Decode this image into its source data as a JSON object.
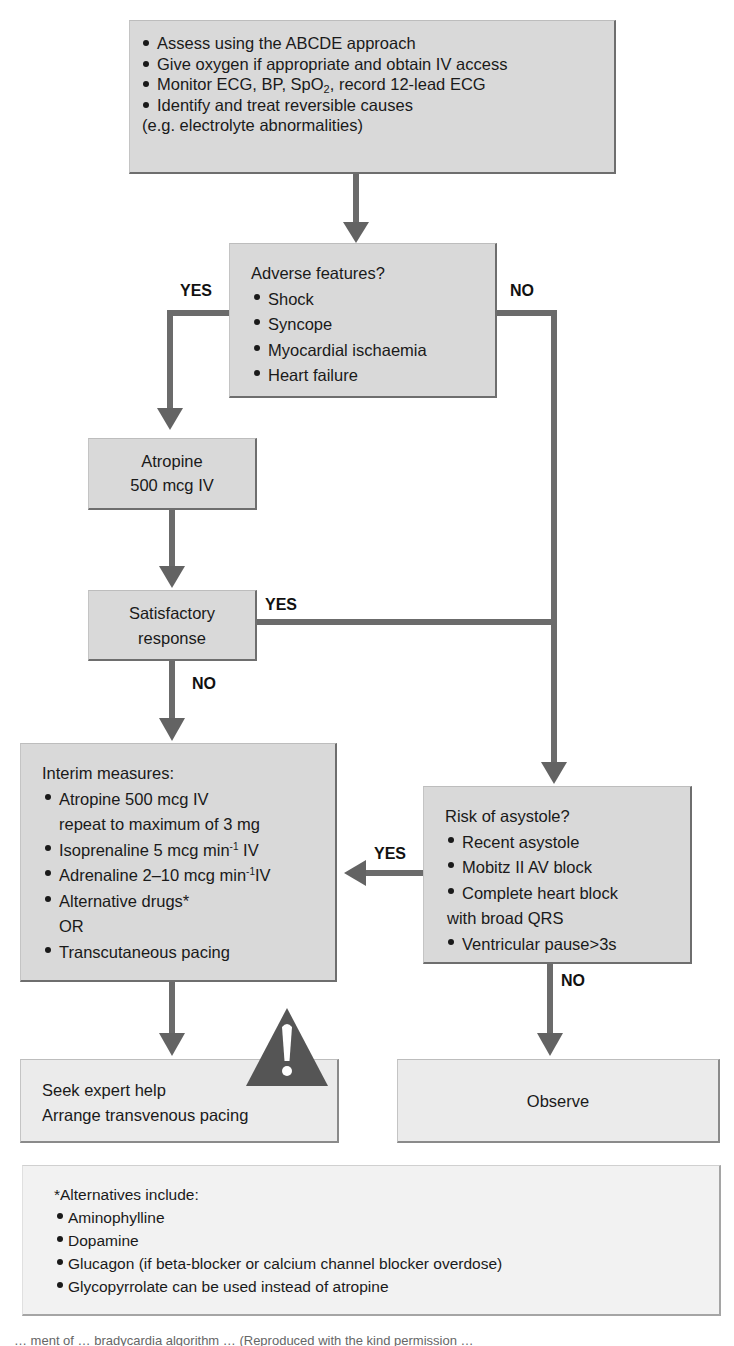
{
  "diagram": {
    "type": "flowchart",
    "title": "Bradycardia algorithm",
    "colors": {
      "box_fill": "#d9d9d9",
      "box_fill_light": "#ebebeb",
      "box_fill_pale": "#f2f2f2",
      "box_shadow_border": "#6e6e6e",
      "connector": "#6b6b6b",
      "warning_triangle": "#555555",
      "text": "#1a1a1a"
    },
    "nodes": {
      "initial": {
        "items": [
          "Assess using the ABCDE approach",
          "Give oxygen if appropriate and obtain IV access",
          "Monitor ECG, BP, SpO",
          "Identify and treat reversible causes"
        ],
        "monitor_sub": "2",
        "monitor_tail": ", record 12-lead ECG",
        "continuation": "(e.g. electrolyte abnormalities)"
      },
      "adverse": {
        "heading": "Adverse features?",
        "items": [
          "Shock",
          "Syncope",
          "Myocardial ischaemia",
          "Heart failure"
        ]
      },
      "atropine": {
        "line1": "Atropine",
        "line2": "500 mcg IV"
      },
      "satisfactory": {
        "line1": "Satisfactory",
        "line2": "response"
      },
      "interim": {
        "heading": "Interim measures:",
        "atropine": "Atropine 500 mcg IV",
        "atropine_cont": "repeat to maximum of 3 mg",
        "isoprenaline": "Isoprenaline 5 mcg min",
        "isoprenaline_sup": "-1",
        "isoprenaline_tail": " IV",
        "adrenaline": "Adrenaline 2–10 mcg min",
        "adrenaline_sup": "-1",
        "adrenaline_tail": "IV",
        "alternative": "Alternative drugs*",
        "or": "OR",
        "pacing": "Transcutaneous pacing"
      },
      "asystole": {
        "heading": "Risk of asystole?",
        "items": [
          "Recent asystole",
          "Mobitz II AV block",
          "Complete heart block"
        ],
        "cont": "with broad QRS",
        "last": "Ventricular pause>3s"
      },
      "expert": {
        "line1": "Seek expert help",
        "line2": "Arrange transvenous pacing"
      },
      "observe": {
        "text": "Observe"
      },
      "alternatives": {
        "heading": "*Alternatives include:",
        "items": [
          "Aminophylline",
          "Dopamine",
          "Glucagon (if beta-blocker or calcium channel blocker overdose)",
          "Glycopyrrolate can be used instead of atropine"
        ]
      }
    },
    "edge_labels": {
      "adverse_yes": "YES",
      "adverse_no": "NO",
      "satisfactory_yes": "YES",
      "satisfactory_no": "NO",
      "asystole_yes": "YES",
      "asystole_no": "NO"
    },
    "edges": [
      {
        "from": "initial",
        "to": "adverse",
        "label": ""
      },
      {
        "from": "adverse",
        "to": "atropine",
        "label": "YES"
      },
      {
        "from": "adverse",
        "to": "asystole",
        "label": "NO"
      },
      {
        "from": "atropine",
        "to": "satisfactory",
        "label": ""
      },
      {
        "from": "satisfactory",
        "to": "asystole",
        "label": "YES"
      },
      {
        "from": "satisfactory",
        "to": "interim",
        "label": "NO"
      },
      {
        "from": "asystole",
        "to": "interim",
        "label": "YES"
      },
      {
        "from": "asystole",
        "to": "observe",
        "label": "NO"
      },
      {
        "from": "interim",
        "to": "expert",
        "label": ""
      }
    ],
    "warning_icon": "warning-triangle-exclamation",
    "caption_fragment": "… ment of …                                    bradycardia algorithm …          (Reproduced with the kind permission …"
  }
}
